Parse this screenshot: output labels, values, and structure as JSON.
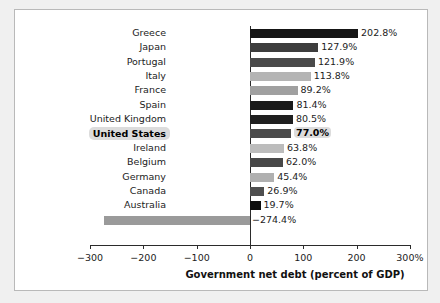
{
  "chart_data": {
    "type": "bar",
    "orientation": "horizontal",
    "title": "",
    "xlabel": "Government net debt (percent of GDP)",
    "ylabel": "",
    "xlim": [
      -300,
      300
    ],
    "xticks": [
      -300,
      -200,
      -100,
      0,
      100,
      200,
      300
    ],
    "xticklabels": [
      "−300",
      "−200",
      "−100",
      "0",
      "100",
      "200",
      "300%"
    ],
    "grid": false,
    "legend": null,
    "categories": [
      "Greece",
      "Japan",
      "Portugal",
      "Italy",
      "France",
      "Spain",
      "United Kingdom",
      "United States",
      "Ireland",
      "Belgium",
      "Germany",
      "Canada",
      "Australia",
      "Norway"
    ],
    "values": [
      202.8,
      127.9,
      121.9,
      113.8,
      89.2,
      81.4,
      80.5,
      77.0,
      63.8,
      62.0,
      45.4,
      26.9,
      19.7,
      -274.4
    ],
    "value_labels": [
      "202.8%",
      "127.9%",
      "121.9%",
      "113.8%",
      "89.2%",
      "81.4%",
      "80.5%",
      "77.0%",
      "63.8%",
      "62.0%",
      "45.4%",
      "26.9%",
      "19.7%",
      "−274.4%"
    ],
    "bar_colors": [
      "#151515",
      "#3d3d3d",
      "#4a4a4a",
      "#b4b4b4",
      "#a0a0a0",
      "#1a1a1a",
      "#1f1f1f",
      "#4b4b4b",
      "#bcbcbc",
      "#484848",
      "#b0b0b0",
      "#4f4f4f",
      "#0e0e0e",
      "#9a9a9a"
    ],
    "highlight_category": "United States"
  },
  "axis": {
    "title": "Government net debt (percent of GDP)"
  },
  "colors": {
    "panel_background": "#ffffff",
    "page_background": "#f0f0f0",
    "axis": "#2b2b2b",
    "text": "#1c1c1c",
    "highlight_background": "#dcdcdc"
  }
}
